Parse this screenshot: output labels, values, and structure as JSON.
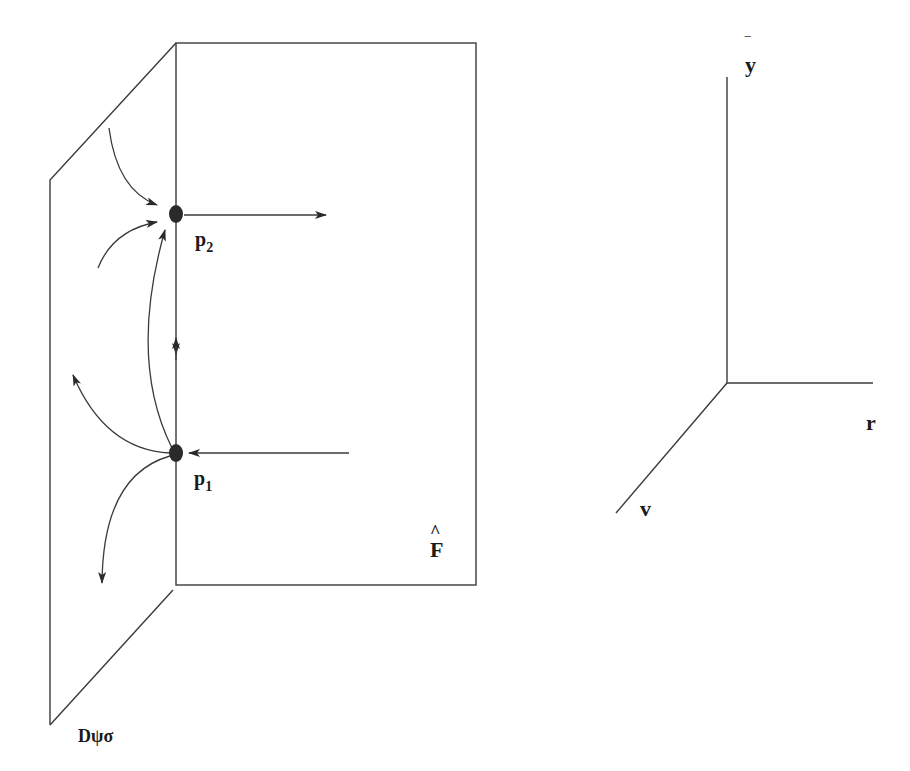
{
  "diagram": {
    "labels": {
      "p2": "p",
      "p2_sub": "2",
      "p1": "p",
      "p1_sub": "1",
      "F_hat": "F",
      "F_hat_accent": "^",
      "plane": "Dψσ",
      "axis_y": "y",
      "axis_y_bar": "‾",
      "axis_r": "r",
      "axis_v": "v"
    },
    "colors": {
      "line": "#3a3a3a",
      "point": "#2a2a2a",
      "text": "#1a1a1a"
    }
  }
}
